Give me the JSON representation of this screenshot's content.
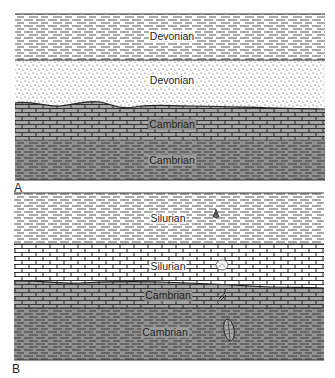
{
  "figure": {
    "panels": [
      {
        "id": "A",
        "label": "A",
        "layers": [
          {
            "name": "Devonian",
            "lithology": "shale",
            "fill": "#ffffff"
          },
          {
            "name": "Devonian",
            "lithology": "sandstone",
            "fill": "#ffffff"
          },
          {
            "name": "Cambrian",
            "lithology": "limestone",
            "fill": "#7a7a7a"
          },
          {
            "name": "Cambrian",
            "lithology": "shale",
            "fill": "#8f8f8f"
          }
        ],
        "unconformity": "erosional surface between Devonian sandstone and Cambrian limestone"
      },
      {
        "id": "B",
        "label": "B",
        "layers": [
          {
            "name": "Silurian",
            "lithology": "shale",
            "fill": "#ffffff",
            "fossil": "gastropod"
          },
          {
            "name": "Silurian",
            "lithology": "limestone",
            "fill": "#ffffff",
            "fossil": "brachiopod"
          },
          {
            "name": "Cambrian",
            "lithology": "limestone",
            "fill": "#8a8a8a",
            "fossil": "fragment"
          },
          {
            "name": "Cambrian",
            "lithology": "shale",
            "fill": "#8f8f8f",
            "fossil": "trilobite"
          }
        ],
        "unconformity": "erosional surface between Silurian limestone and Cambrian limestone"
      }
    ],
    "colors": {
      "line": "#333333",
      "dash_light": "#555555",
      "dash_dark": "#3a3a3a",
      "limestone_dark": "#7a7a7a",
      "shale_gray": "#8f8f8f"
    }
  }
}
